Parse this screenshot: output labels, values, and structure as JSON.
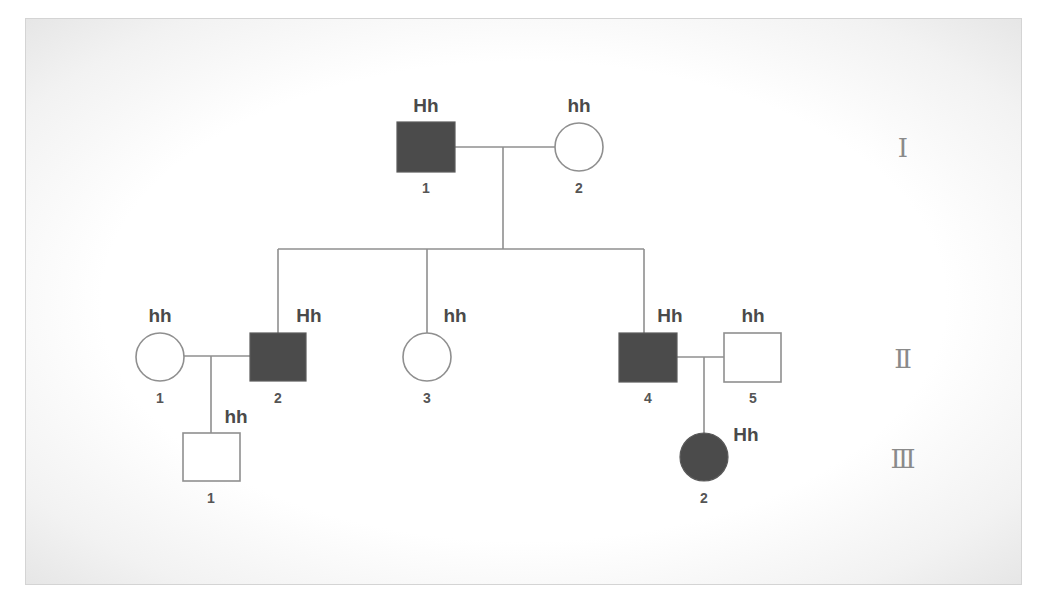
{
  "diagram": {
    "type": "pedigree",
    "colors": {
      "affected_fill": "#4b4b4b",
      "unaffected_fill": "#ffffff",
      "line": "#8f8f8f",
      "text": "#4a4a4a"
    },
    "generations": [
      {
        "label": "Ⅰ",
        "roman": "I"
      },
      {
        "label": "Ⅱ",
        "roman": "II"
      },
      {
        "label": "Ⅲ",
        "roman": "III"
      }
    ],
    "individuals": {
      "I_1": {
        "id": "1",
        "generation": "I",
        "sex": "male",
        "affected": true,
        "genotype": "Hh"
      },
      "I_2": {
        "id": "2",
        "generation": "I",
        "sex": "female",
        "affected": false,
        "genotype": "hh"
      },
      "II_1": {
        "id": "1",
        "generation": "II",
        "sex": "female",
        "affected": false,
        "genotype": "hh"
      },
      "II_2": {
        "id": "2",
        "generation": "II",
        "sex": "male",
        "affected": true,
        "genotype": "Hh"
      },
      "II_3": {
        "id": "3",
        "generation": "II",
        "sex": "female",
        "affected": false,
        "genotype": "hh"
      },
      "II_4": {
        "id": "4",
        "generation": "II",
        "sex": "male",
        "affected": true,
        "genotype": "Hh"
      },
      "II_5": {
        "id": "5",
        "generation": "II",
        "sex": "male",
        "affected": false,
        "genotype": "hh"
      },
      "III_1": {
        "id": "1",
        "generation": "III",
        "sex": "male",
        "affected": false,
        "genotype": "hh"
      },
      "III_2": {
        "id": "2",
        "generation": "III",
        "sex": "female",
        "affected": true,
        "genotype": "Hh"
      }
    },
    "relationships": [
      {
        "type": "mating",
        "partners": [
          "I_1",
          "I_2"
        ],
        "children": [
          "II_2",
          "II_3",
          "II_4"
        ]
      },
      {
        "type": "mating",
        "partners": [
          "II_1",
          "II_2"
        ],
        "children": [
          "III_1"
        ]
      },
      {
        "type": "mating",
        "partners": [
          "II_4",
          "II_5"
        ],
        "children": [
          "III_2"
        ]
      }
    ]
  }
}
